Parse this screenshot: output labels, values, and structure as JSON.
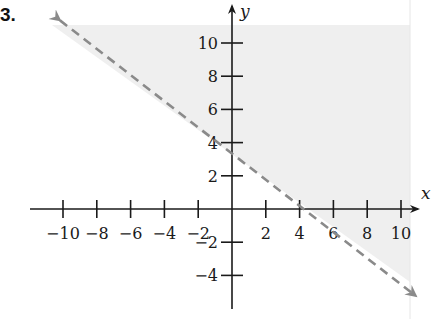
{
  "problem_number": "3.",
  "chart_data": {
    "type": "line",
    "title": "",
    "xlabel": "x",
    "ylabel": "y",
    "xlim": [
      -11,
      11
    ],
    "ylim": [
      -5,
      11
    ],
    "x_ticks": [
      -10,
      -8,
      -6,
      -4,
      -2,
      2,
      4,
      6,
      8,
      10
    ],
    "y_ticks": [
      -4,
      -2,
      2,
      4,
      6,
      8,
      10
    ],
    "grid": false,
    "series": [
      {
        "name": "boundary line",
        "style": "dashed",
        "color": "#8a8a8a",
        "arrows": "both",
        "slope": -0.8,
        "y_intercept": 3.2,
        "x_intercept": 4,
        "points": [
          {
            "x": -10,
            "y": 11
          },
          {
            "x": 11,
            "y": -5.6
          }
        ]
      }
    ],
    "shaded_region": {
      "side": "above line",
      "color": "#efefef",
      "inequality": "y > -0.8x + 3.2"
    }
  },
  "colors": {
    "shade": "#efefef",
    "line": "#8a8a8a",
    "axis": "#1a1a1a"
  }
}
